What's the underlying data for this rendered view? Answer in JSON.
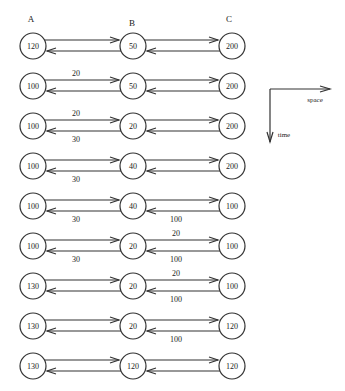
{
  "diagram": {
    "node_headers": [
      {
        "label": "A",
        "x": 31,
        "y": 22
      },
      {
        "label": "B",
        "x": 132,
        "y": 26
      },
      {
        "label": "C",
        "x": 229,
        "y": 22
      }
    ],
    "node_x": [
      33,
      133,
      232
    ],
    "node_radius": 13,
    "rows": [
      {
        "y": 46,
        "values": [
          "120",
          "50",
          "200"
        ],
        "ab_top": "",
        "ab_bottom": "",
        "bc_top": "",
        "bc_bottom": ""
      },
      {
        "y": 86,
        "values": [
          "100",
          "50",
          "200"
        ],
        "ab_top": "20",
        "ab_bottom": "",
        "bc_top": "",
        "bc_bottom": ""
      },
      {
        "y": 126,
        "values": [
          "100",
          "20",
          "200"
        ],
        "ab_top": "20",
        "ab_bottom": "30",
        "bc_top": "",
        "bc_bottom": ""
      },
      {
        "y": 166,
        "values": [
          "100",
          "40",
          "200"
        ],
        "ab_top": "",
        "ab_bottom": "30",
        "bc_top": "",
        "bc_bottom": ""
      },
      {
        "y": 206,
        "values": [
          "100",
          "40",
          "100"
        ],
        "ab_top": "",
        "ab_bottom": "30",
        "bc_top": "",
        "bc_bottom": "100"
      },
      {
        "y": 246,
        "values": [
          "100",
          "20",
          "100"
        ],
        "ab_top": "",
        "ab_bottom": "30",
        "bc_top": "20",
        "bc_bottom": "100"
      },
      {
        "y": 286,
        "values": [
          "130",
          "20",
          "100"
        ],
        "ab_top": "",
        "ab_bottom": "",
        "bc_top": "20",
        "bc_bottom": "100"
      },
      {
        "y": 326,
        "values": [
          "130",
          "20",
          "120"
        ],
        "ab_top": "",
        "ab_bottom": "",
        "bc_top": "",
        "bc_bottom": "100"
      },
      {
        "y": 366,
        "values": [
          "130",
          "120",
          "120"
        ],
        "ab_top": "",
        "ab_bottom": "",
        "bc_top": "",
        "bc_bottom": ""
      }
    ],
    "axes": {
      "origin": {
        "x": 270,
        "y": 89
      },
      "space_end_x": 330,
      "time_end_y": 142,
      "space_label": "space",
      "time_label": "time"
    },
    "stroke_color": "#333333"
  }
}
